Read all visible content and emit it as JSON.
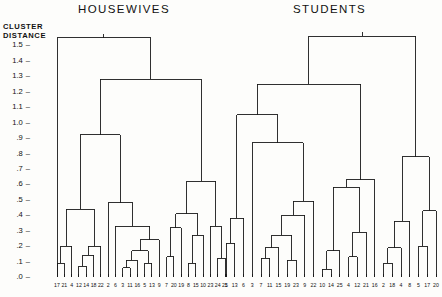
{
  "figure": {
    "axis_caption_line1": "CLUSTER",
    "axis_caption_line2": "DISTANCE",
    "tick_dash": "–"
  },
  "panels": [
    {
      "id": "housewives",
      "title": "HOUSEWIVES"
    },
    {
      "id": "students",
      "title": "STUDENTS"
    }
  ],
  "chart_data": {
    "type": "line",
    "subtitle": "",
    "xlabel": "",
    "ylabel": "CLUSTER DISTANCE",
    "ylim": [
      0.0,
      1.6
    ],
    "grid": false,
    "legend": "none",
    "yticks": [
      0.0,
      0.1,
      0.2,
      0.3,
      0.4,
      0.5,
      0.6,
      0.7,
      0.8,
      0.9,
      1.0,
      1.1,
      1.2,
      1.3,
      1.4,
      1.5
    ],
    "ytick_labels": [
      ".0",
      ".1",
      ".2",
      ".3",
      ".4",
      ".5",
      ".6",
      ".7",
      ".8",
      ".9",
      "1.0",
      "1.1",
      "1.2",
      "1.3",
      "1.4",
      "1.5"
    ],
    "panels": [
      {
        "name": "HOUSEWIVES",
        "leaf_labels": [
          "17",
          "21",
          "4",
          "12",
          "14",
          "18",
          "22",
          "2",
          "6",
          "3",
          "11",
          "16",
          "5",
          "13",
          "9",
          "7",
          "20",
          "19",
          "8",
          "15",
          "10",
          "23",
          "24",
          "25"
        ],
        "merges": [
          {
            "left": {
              "leaf": 0
            },
            "right": {
              "leaf": 1
            },
            "height": 0.09
          },
          {
            "left": {
              "node": 0
            },
            "right": {
              "leaf": 2
            },
            "height": 0.2
          },
          {
            "left": {
              "leaf": 3
            },
            "right": {
              "leaf": 4
            },
            "height": 0.07
          },
          {
            "left": {
              "node": 2
            },
            "right": {
              "leaf": 5
            },
            "height": 0.14
          },
          {
            "left": {
              "node": 3
            },
            "right": {
              "leaf": 6
            },
            "height": 0.2
          },
          {
            "left": {
              "node": 1
            },
            "right": {
              "node": 4
            },
            "height": 0.44
          },
          {
            "left": {
              "leaf": 9
            },
            "right": {
              "leaf": 10
            },
            "height": 0.06
          },
          {
            "left": {
              "node": 6
            },
            "right": {
              "leaf": 11
            },
            "height": 0.11
          },
          {
            "left": {
              "leaf": 12
            },
            "right": {
              "leaf": 13
            },
            "height": 0.09
          },
          {
            "left": {
              "node": 7
            },
            "right": {
              "node": 8
            },
            "height": 0.17
          },
          {
            "left": {
              "node": 9
            },
            "right": {
              "leaf": 14
            },
            "height": 0.24
          },
          {
            "left": {
              "leaf": 8
            },
            "right": {
              "node": 10
            },
            "height": 0.33
          },
          {
            "left": {
              "leaf": 7
            },
            "right": {
              "node": 11
            },
            "height": 0.48
          },
          {
            "left": {
              "node": 5
            },
            "right": {
              "node": 12
            },
            "height": 0.92
          },
          {
            "left": {
              "leaf": 15
            },
            "right": {
              "leaf": 16
            },
            "height": 0.13
          },
          {
            "left": {
              "node": 14
            },
            "right": {
              "leaf": 17
            },
            "height": 0.32
          },
          {
            "left": {
              "leaf": 18
            },
            "right": {
              "leaf": 19
            },
            "height": 0.09
          },
          {
            "left": {
              "node": 16
            },
            "right": {
              "leaf": 20
            },
            "height": 0.27
          },
          {
            "left": {
              "node": 15
            },
            "right": {
              "node": 17
            },
            "height": 0.41
          },
          {
            "left": {
              "leaf": 22
            },
            "right": {
              "leaf": 23
            },
            "height": 0.12
          },
          {
            "left": {
              "leaf": 21
            },
            "right": {
              "node": 19
            },
            "height": 0.33
          },
          {
            "left": {
              "node": 18
            },
            "right": {
              "node": 20
            },
            "height": 0.62
          },
          {
            "left": {
              "node": 13
            },
            "right": {
              "node": 21
            },
            "height": 1.28
          },
          {
            "left": {
              "leaf": -1
            },
            "right": {
              "node": 22
            },
            "height": 1.55
          }
        ],
        "root_left_leaf": 0
      },
      {
        "name": "STUDENTS",
        "leaf_labels": [
          "1",
          "13",
          "6",
          "3",
          "7",
          "11",
          "15",
          "19",
          "23",
          "9",
          "22",
          "10",
          "14",
          "25",
          "4",
          "12",
          "21",
          "16",
          "2",
          "18",
          "4",
          "8",
          "5",
          "17",
          "20"
        ],
        "merges": [
          {
            "left": {
              "leaf": 0
            },
            "right": {
              "leaf": 1
            },
            "height": 0.22
          },
          {
            "left": {
              "node": 0
            },
            "right": {
              "leaf": 2
            },
            "height": 0.38
          },
          {
            "left": {
              "leaf": 4
            },
            "right": {
              "leaf": 5
            },
            "height": 0.12
          },
          {
            "left": {
              "node": 2
            },
            "right": {
              "leaf": 6
            },
            "height": 0.19
          },
          {
            "left": {
              "leaf": 7
            },
            "right": {
              "leaf": 8
            },
            "height": 0.11
          },
          {
            "left": {
              "node": 3
            },
            "right": {
              "node": 4
            },
            "height": 0.27
          },
          {
            "left": {
              "node": 5
            },
            "right": {
              "leaf": 9
            },
            "height": 0.4
          },
          {
            "left": {
              "node": 6
            },
            "right": {
              "leaf": 10
            },
            "height": 0.49
          },
          {
            "left": {
              "leaf": 3
            },
            "right": {
              "node": 7
            },
            "height": 0.87
          },
          {
            "left": {
              "node": 1
            },
            "right": {
              "node": 8
            },
            "height": 1.05
          },
          {
            "left": {
              "leaf": 11
            },
            "right": {
              "leaf": 12
            },
            "height": 0.05
          },
          {
            "left": {
              "node": 10
            },
            "right": {
              "leaf": 13
            },
            "height": 0.17
          },
          {
            "left": {
              "leaf": 14
            },
            "right": {
              "leaf": 15
            },
            "height": 0.13
          },
          {
            "left": {
              "node": 12
            },
            "right": {
              "leaf": 16
            },
            "height": 0.29
          },
          {
            "left": {
              "node": 11
            },
            "right": {
              "node": 13
            },
            "height": 0.58
          },
          {
            "left": {
              "node": 14
            },
            "right": {
              "leaf": 17
            },
            "height": 0.63
          },
          {
            "left": {
              "node": 9
            },
            "right": {
              "node": 15
            },
            "height": 1.25
          },
          {
            "left": {
              "leaf": 18
            },
            "right": {
              "leaf": 19
            },
            "height": 0.09
          },
          {
            "left": {
              "node": 17
            },
            "right": {
              "leaf": 20
            },
            "height": 0.19
          },
          {
            "left": {
              "node": 18
            },
            "right": {
              "leaf": 21
            },
            "height": 0.36
          },
          {
            "left": {
              "leaf": 22
            },
            "right": {
              "leaf": 23
            },
            "height": 0.2
          },
          {
            "left": {
              "node": 20
            },
            "right": {
              "leaf": 24
            },
            "height": 0.43
          },
          {
            "left": {
              "node": 19
            },
            "right": {
              "node": 21
            },
            "height": 0.78
          },
          {
            "left": {
              "node": 16
            },
            "right": {
              "node": 22
            },
            "height": 1.56
          }
        ]
      }
    ]
  },
  "geometry": {
    "plot_top_y": 30,
    "plot_bottom_y": 277,
    "value_at_top": 1.6,
    "value_at_bottom": 0.0,
    "panel_x": [
      57,
      226
    ],
    "panel_width": [
      168,
      210
    ],
    "label_y": 282
  }
}
